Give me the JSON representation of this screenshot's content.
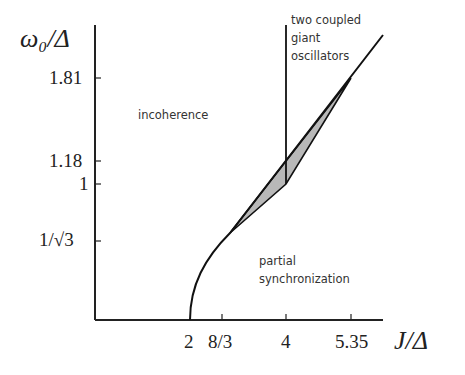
{
  "diagram": {
    "y_axis": {
      "title": "ω₀/Δ",
      "ticks": [
        {
          "label": "1.81",
          "value": 1.81
        },
        {
          "label": "1.18",
          "value": 1.18
        },
        {
          "label": "1",
          "value": 1
        },
        {
          "label": "1/√3",
          "value": 0.577
        }
      ]
    },
    "x_axis": {
      "title": "J/Δ",
      "ticks": [
        {
          "label": "2",
          "value": 2
        },
        {
          "label": "8/3",
          "value": 2.667
        },
        {
          "label": "4",
          "value": 4
        },
        {
          "label": "5.35",
          "value": 5.35
        }
      ]
    },
    "regions": {
      "incoherence": "incoherence",
      "partial_sync_line1": "partial",
      "partial_sync_line2": "synchronization",
      "two_coupled_line1": "two coupled",
      "two_coupled_line2": "giant",
      "two_coupled_line3": "oscillators"
    },
    "colors": {
      "line": "#111111",
      "shaded": "#b8b8b8"
    }
  }
}
